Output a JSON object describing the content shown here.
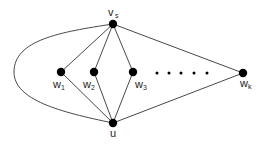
{
  "diagram": {
    "type": "graph",
    "colors": {
      "node": "#000000",
      "edge": "#333333",
      "label": "#222222",
      "background": "#ffffff"
    },
    "nodes": [
      {
        "id": "v_s",
        "label": "v",
        "subscript": "s",
        "x": 113,
        "y": 24
      },
      {
        "id": "w_1",
        "label": "w",
        "subscript": "1",
        "x": 61,
        "y": 72
      },
      {
        "id": "w_2",
        "label": "w",
        "subscript": "2",
        "x": 94,
        "y": 72
      },
      {
        "id": "w_3",
        "label": "w",
        "subscript": "3",
        "x": 133,
        "y": 72
      },
      {
        "id": "w_k",
        "label": "w",
        "subscript": "k",
        "x": 243,
        "y": 73
      },
      {
        "id": "u",
        "label": "u",
        "subscript": "",
        "x": 113,
        "y": 123
      }
    ],
    "ellipsis_dots": [
      157,
      169,
      181,
      194,
      207
    ],
    "edges": [
      [
        "v_s",
        "w_1"
      ],
      [
        "v_s",
        "w_2"
      ],
      [
        "v_s",
        "w_3"
      ],
      [
        "v_s",
        "w_k"
      ],
      [
        "u",
        "w_1"
      ],
      [
        "u",
        "w_2"
      ],
      [
        "u",
        "w_3"
      ],
      [
        "u",
        "w_k"
      ],
      [
        "v_s",
        "u",
        "curved-left"
      ]
    ]
  }
}
